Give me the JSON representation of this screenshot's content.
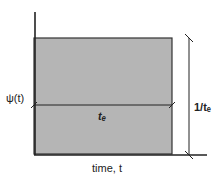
{
  "diagram": {
    "y_label": "ψ(t)",
    "x_label": "time, t",
    "width_label": "tₑ",
    "height_label": "1/tₑ",
    "colors": {
      "fill": "#b5b5b5",
      "line": "#222222"
    }
  }
}
